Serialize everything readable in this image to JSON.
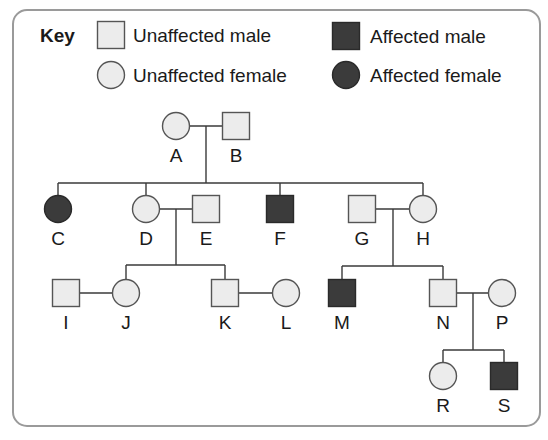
{
  "colors": {
    "frame": "#9a9a9a",
    "unaffected_fill": "#ececec",
    "affected_fill": "#3b3b3b",
    "outline": "#555555",
    "line": "#3a3a3a",
    "text": "#1a1a1a"
  },
  "key": {
    "title": "Key",
    "items": [
      {
        "label": "Unaffected male",
        "sex": "male",
        "affected": false,
        "x": 111,
        "y": 35,
        "tx": 133
      },
      {
        "label": "Unaffected female",
        "sex": "female",
        "affected": false,
        "x": 111,
        "y": 75,
        "tx": 133
      },
      {
        "label": "Affected male",
        "sex": "male",
        "affected": true,
        "x": 346,
        "y": 36,
        "tx": 370
      },
      {
        "label": "Affected female",
        "sex": "female",
        "affected": true,
        "x": 346,
        "y": 75,
        "tx": 370
      }
    ]
  },
  "chart_data": {
    "type": "pedigree",
    "title": "Key",
    "legend": [
      "Unaffected male",
      "Unaffected female",
      "Affected male",
      "Affected female"
    ],
    "individuals": [
      {
        "id": "A",
        "sex": "female",
        "affected": false,
        "generation": 1,
        "x": 176,
        "y": 126
      },
      {
        "id": "B",
        "sex": "male",
        "affected": false,
        "generation": 1,
        "x": 236,
        "y": 126
      },
      {
        "id": "C",
        "sex": "female",
        "affected": true,
        "generation": 2,
        "x": 58,
        "y": 209
      },
      {
        "id": "D",
        "sex": "female",
        "affected": false,
        "generation": 2,
        "x": 146,
        "y": 209
      },
      {
        "id": "E",
        "sex": "male",
        "affected": false,
        "generation": 2,
        "x": 206,
        "y": 209
      },
      {
        "id": "F",
        "sex": "male",
        "affected": true,
        "generation": 2,
        "x": 280,
        "y": 209
      },
      {
        "id": "G",
        "sex": "male",
        "affected": false,
        "generation": 2,
        "x": 362,
        "y": 209
      },
      {
        "id": "H",
        "sex": "female",
        "affected": false,
        "generation": 2,
        "x": 423,
        "y": 209
      },
      {
        "id": "I",
        "sex": "male",
        "affected": false,
        "generation": 3,
        "x": 66,
        "y": 293
      },
      {
        "id": "J",
        "sex": "female",
        "affected": false,
        "generation": 3,
        "x": 126,
        "y": 293
      },
      {
        "id": "K",
        "sex": "male",
        "affected": false,
        "generation": 3,
        "x": 225,
        "y": 293
      },
      {
        "id": "L",
        "sex": "female",
        "affected": false,
        "generation": 3,
        "x": 286,
        "y": 293
      },
      {
        "id": "M",
        "sex": "male",
        "affected": true,
        "generation": 3,
        "x": 342,
        "y": 293
      },
      {
        "id": "N",
        "sex": "male",
        "affected": false,
        "generation": 3,
        "x": 443,
        "y": 293
      },
      {
        "id": "P",
        "sex": "female",
        "affected": false,
        "generation": 3,
        "x": 502,
        "y": 293
      },
      {
        "id": "R",
        "sex": "female",
        "affected": false,
        "generation": 4,
        "x": 443,
        "y": 376
      },
      {
        "id": "S",
        "sex": "male",
        "affected": true,
        "generation": 4,
        "x": 504,
        "y": 376
      }
    ],
    "couples": [
      {
        "partners": [
          "A",
          "B"
        ],
        "children": [
          "C",
          "D",
          "F",
          "H"
        ],
        "drop_x": 206,
        "sib_y": 183
      },
      {
        "partners": [
          "D",
          "E"
        ],
        "children": [
          "J",
          "K"
        ],
        "drop_x": 176,
        "sib_y": 265
      },
      {
        "partners": [
          "G",
          "H"
        ],
        "children": [
          "M",
          "N"
        ],
        "drop_x": 393,
        "sib_y": 266
      },
      {
        "partners": [
          "N",
          "P"
        ],
        "children": [
          "R",
          "S"
        ],
        "drop_x": 473,
        "sib_y": 350
      }
    ],
    "marriages_no_children": [
      {
        "partners": [
          "I",
          "J"
        ]
      },
      {
        "partners": [
          "K",
          "L"
        ]
      }
    ]
  }
}
